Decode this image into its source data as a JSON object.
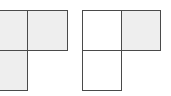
{
  "figures": [
    {
      "name": "left-L-shape",
      "cells": [
        {
          "row": 0,
          "col": 0,
          "shaded": true
        },
        {
          "row": 0,
          "col": 1,
          "shaded": true
        },
        {
          "row": 1,
          "col": 0,
          "shaded": true
        }
      ]
    },
    {
      "name": "right-L-shape",
      "cells": [
        {
          "row": 0,
          "col": 0,
          "shaded": false
        },
        {
          "row": 0,
          "col": 1,
          "shaded": true
        },
        {
          "row": 1,
          "col": 0,
          "shaded": false
        }
      ]
    }
  ],
  "colors": {
    "shaded": "#eeeeee",
    "plain": "#ffffff",
    "border": "#4a4a4a"
  }
}
